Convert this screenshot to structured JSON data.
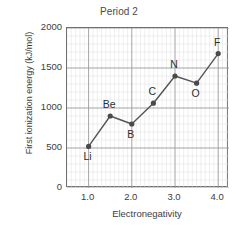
{
  "chart_data": {
    "type": "line",
    "title": "Period 2",
    "xlabel": "Electronegativity",
    "ylabel": "First ionization energy (kJ/mol)",
    "xlim": [
      0.5,
      4.25
    ],
    "ylim": [
      0,
      2000
    ],
    "grid": true,
    "minor_grid": true,
    "legend": "none",
    "x_ticks": [
      "1.0",
      "2.0",
      "3.0",
      "4.0"
    ],
    "x_tick_values": [
      1.0,
      2.0,
      3.0,
      4.0
    ],
    "y_ticks": [
      "0",
      "500",
      "1000",
      "1500",
      "2000"
    ],
    "y_tick_values": [
      0,
      500,
      1000,
      1500,
      2000
    ],
    "series": [
      {
        "name": "Period 2 elements",
        "marker": "circle",
        "line_color": "#555555",
        "marker_color": "#4a4a4a",
        "points": [
          {
            "label": "Li",
            "x": 1.0,
            "y": 520,
            "label_pos": "below"
          },
          {
            "label": "Be",
            "x": 1.5,
            "y": 900,
            "label_pos": "above"
          },
          {
            "label": "B",
            "x": 2.0,
            "y": 800,
            "label_pos": "below"
          },
          {
            "label": "C",
            "x": 2.5,
            "y": 1060,
            "label_pos": "above"
          },
          {
            "label": "N",
            "x": 3.0,
            "y": 1400,
            "label_pos": "above"
          },
          {
            "label": "O",
            "x": 3.5,
            "y": 1310,
            "label_pos": "below"
          },
          {
            "label": "F",
            "x": 4.0,
            "y": 1680,
            "label_pos": "above"
          }
        ]
      }
    ],
    "colors": {
      "axis": "#707070",
      "major_grid": "#9a9a9a",
      "minor_grid": "#dedede",
      "text": "#3d3d3d",
      "background": "#ffffff"
    }
  }
}
